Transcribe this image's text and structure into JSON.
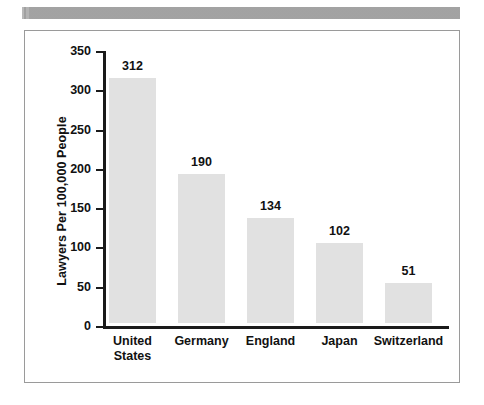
{
  "decor": {
    "top_band_name": "top-gray-band",
    "band_color": "#a9a9a9"
  },
  "chart_data": {
    "type": "bar",
    "title": "",
    "xlabel": "",
    "ylabel": "Lawyers Per 100,000 People",
    "categories": [
      "United States",
      "Germany",
      "England",
      "Japan",
      "Switzerland"
    ],
    "category_lines": [
      [
        "United",
        "States"
      ],
      [
        "Germany"
      ],
      [
        "England"
      ],
      [
        "Japan"
      ],
      [
        "Switzerland"
      ]
    ],
    "values": [
      312,
      190,
      134,
      102,
      51
    ],
    "value_labels": [
      "312",
      "190",
      "134",
      "102",
      "51"
    ],
    "ylim": [
      0,
      350
    ],
    "ytick_values": [
      0,
      50,
      100,
      150,
      200,
      250,
      300,
      350
    ],
    "ytick_labels": [
      "0",
      "50",
      "100",
      "150",
      "200",
      "250",
      "300",
      "350"
    ],
    "grid": false,
    "legend": null,
    "bar_color": "#e1e1e1",
    "axis_color": "#1a1a1a"
  }
}
